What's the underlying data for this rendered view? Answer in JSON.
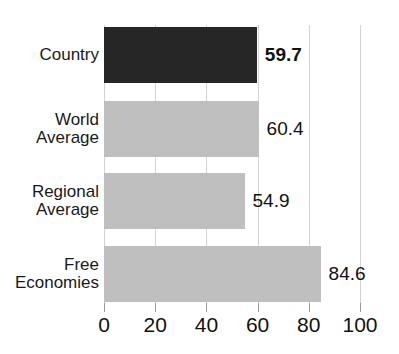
{
  "chart_data": {
    "type": "bar",
    "orientation": "horizontal",
    "title": "Economic Freedom Score",
    "categories": [
      "Country",
      "World\nAverage",
      "Regional\nAverage",
      "Free\nEconomies"
    ],
    "values": [
      59.7,
      60.4,
      54.9,
      84.6
    ],
    "value_labels": [
      "59.7",
      "60.4",
      "54.9",
      "84.6"
    ],
    "xlabel": "",
    "ylabel": "",
    "xlim": [
      0,
      100
    ],
    "xticks": [
      0,
      20,
      40,
      60,
      80,
      100
    ],
    "xtick_labels": [
      "0",
      "20",
      "40",
      "60",
      "80",
      "100"
    ],
    "grid": true,
    "grid_axis": "x",
    "legend": false,
    "bar_colors": [
      "#262626",
      "#bfbfbf",
      "#bfbfbf",
      "#bfbfbf"
    ],
    "highlight_index": 0,
    "colors": {
      "highlight_bar": "#262626",
      "default_bar": "#bfbfbf",
      "gridline": "#d2d2d2",
      "text": "#111111",
      "background": "#ffffff"
    }
  }
}
